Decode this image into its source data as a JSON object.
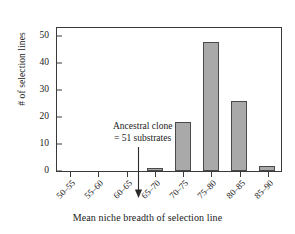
{
  "chart_data": {
    "type": "bar",
    "title": "",
    "xlabel": "Mean niche breadth of selection line",
    "ylabel": "# of selection lines",
    "categories": [
      "50–55",
      "55–60",
      "60–65",
      "65–70",
      "70–75",
      "75–80",
      "80–85",
      "85–90"
    ],
    "values": [
      0,
      0,
      0,
      1,
      18,
      48,
      26,
      2
    ],
    "ylim": [
      0,
      53
    ],
    "yticks": [
      0,
      10,
      20,
      30,
      40,
      50
    ],
    "ytick_labels": [
      "0",
      "10",
      "20",
      "30",
      "40",
      "50"
    ],
    "grid": false,
    "legend": null,
    "bar_color": "#a9a9a9",
    "bar_edge_color": "#4a4a4a",
    "axis_color": "#3a3a3a",
    "annotations": [
      {
        "name": "ancestral-clone-note",
        "line1": "Ancestral clone",
        "line2": "= 51 substrates",
        "arrow": "down-arrow",
        "points_to_category": "50–55"
      }
    ]
  }
}
